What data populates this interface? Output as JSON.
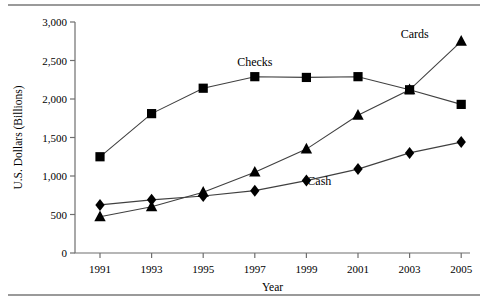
{
  "chart_data": {
    "type": "line",
    "title": "",
    "xlabel": "Year",
    "ylabel": "U.S. Dollars (Billions)",
    "x": [
      1991,
      1993,
      1995,
      1997,
      1999,
      2001,
      2003,
      2005
    ],
    "xtick_labels": [
      "1991",
      "1993",
      "1995",
      "1997",
      "1999",
      "2001",
      "2003",
      "2005"
    ],
    "ytick_labels": [
      "0",
      "500",
      "1,000",
      "1,500",
      "2,000",
      "2,500",
      "3,000"
    ],
    "ytick_values": [
      0,
      500,
      1000,
      1500,
      2000,
      2500,
      3000
    ],
    "ylim": [
      0,
      3000
    ],
    "xlim": [
      1990,
      2006
    ],
    "grid": false,
    "legend_position": "inline-annotations",
    "series": [
      {
        "name": "Checks",
        "marker": "square",
        "values": [
          1250,
          1810,
          2140,
          2290,
          2280,
          2290,
          2120,
          1930
        ]
      },
      {
        "name": "Cash",
        "marker": "diamond",
        "values": [
          625,
          690,
          740,
          810,
          940,
          1090,
          1300,
          1440
        ]
      },
      {
        "name": "Cards",
        "marker": "triangle",
        "values": [
          470,
          600,
          790,
          1050,
          1350,
          1790,
          2120,
          2750
        ]
      }
    ],
    "annotations": [
      {
        "text": "Checks",
        "x": 1997,
        "y": 2430
      },
      {
        "text": "Cash",
        "x": 1999.5,
        "y": 880
      },
      {
        "text": "Cards",
        "x": 2003.2,
        "y": 2790
      }
    ]
  }
}
